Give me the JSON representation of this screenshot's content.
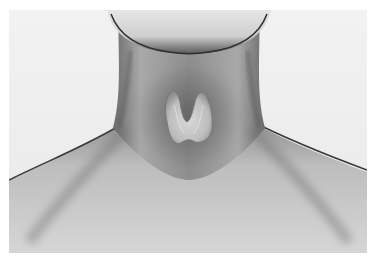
{
  "image": {
    "subject": "3D render of human neck with thyroid gland",
    "style": "grayscale",
    "colors": {
      "background": "#eeeeee",
      "skin_light": "#d8d8d8",
      "skin_mid": "#a8a8a8",
      "skin_dark": "#6e6e6e",
      "thyroid": "#c9c9c9",
      "page_margin": "#ffffff"
    },
    "elements": [
      "chin",
      "neck",
      "thyroid-gland",
      "left-shoulder",
      "right-shoulder",
      "clavicle-area"
    ]
  }
}
